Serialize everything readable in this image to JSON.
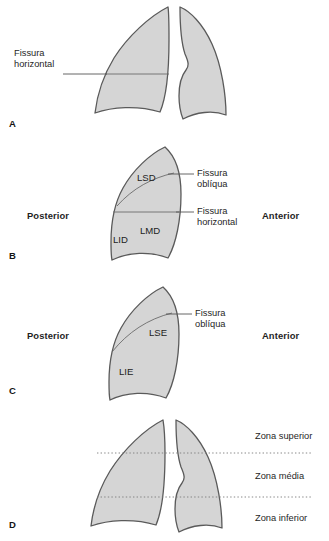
{
  "figure": {
    "type": "medical-anatomy-diagram",
    "language": "pt"
  },
  "colors": {
    "lung_fill": "#d5d5d5",
    "lung_stroke": "#5a5a5a",
    "fissure_line": "#6b6b6b",
    "leader_line": "#555555",
    "zone_divider": "#7a7a7a",
    "text": "#1f1f1f",
    "background": "#ffffff"
  },
  "panels": [
    {
      "id": "a",
      "letter": "A",
      "view": "frontal",
      "labels": [
        {
          "name": "fissura-horizontal",
          "line1": "Fissura",
          "line2": "horizontal"
        }
      ]
    },
    {
      "id": "b",
      "letter": "B",
      "view": "right-lateral",
      "orientation": {
        "left": "Posterior",
        "right": "Anterior"
      },
      "lobes": [
        {
          "abbr": "LSD",
          "name": "lobo-superior-direito"
        },
        {
          "abbr": "LMD",
          "name": "lobo-medio-direito"
        },
        {
          "abbr": "LID",
          "name": "lobo-inferior-direito"
        }
      ],
      "labels": [
        {
          "name": "fissura-obliqua",
          "line1": "Fissura",
          "line2": "oblíqua"
        },
        {
          "name": "fissura-horizontal",
          "line1": "Fissura",
          "line2": "horizontal"
        }
      ]
    },
    {
      "id": "c",
      "letter": "C",
      "view": "left-lateral",
      "orientation": {
        "left": "Posterior",
        "right": "Anterior"
      },
      "lobes": [
        {
          "abbr": "LSE",
          "name": "lobo-superior-esquerdo"
        },
        {
          "abbr": "LIE",
          "name": "lobo-inferior-esquerdo"
        }
      ],
      "labels": [
        {
          "name": "fissura-obliqua",
          "line1": "Fissura",
          "line2": "oblíqua"
        }
      ]
    },
    {
      "id": "d",
      "letter": "D",
      "view": "frontal",
      "zones": [
        {
          "name": "zona-superior",
          "label": "Zona superior"
        },
        {
          "name": "zona-media",
          "label": "Zona média"
        },
        {
          "name": "zona-inferior",
          "label": "Zona inferior"
        }
      ]
    }
  ]
}
